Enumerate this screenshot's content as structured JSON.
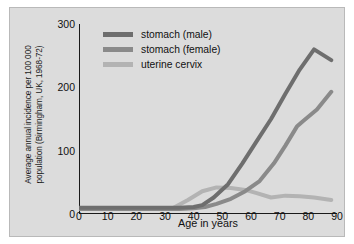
{
  "chart_data": {
    "type": "line",
    "title": "",
    "xlabel": "Age in years",
    "ylabel": "Average annual incidence per 100 000 population (Birmingham, UK, 1968-72)",
    "xlim": [
      0,
      90
    ],
    "ylim": [
      0,
      300
    ],
    "xticks": [
      0,
      10,
      20,
      30,
      40,
      50,
      60,
      70,
      80,
      90
    ],
    "yticks": [
      0,
      100,
      200,
      300
    ],
    "grid": false,
    "legend_position": "top-left-inside",
    "series": [
      {
        "name": "stomach (male)",
        "color": "#6e6e6e",
        "x": [
          0,
          10,
          20,
          30,
          35,
          40,
          43,
          47,
          52,
          57,
          62,
          67,
          72,
          77,
          82,
          88
        ],
        "y": [
          10,
          10,
          10,
          10,
          10,
          11,
          14,
          26,
          47,
          80,
          115,
          150,
          190,
          228,
          260,
          243
        ]
      },
      {
        "name": "stomach (female)",
        "color": "#8a8a8a",
        "x": [
          0,
          10,
          20,
          30,
          35,
          40,
          44,
          48,
          53,
          58,
          63,
          68,
          72,
          76,
          78,
          83,
          88
        ],
        "y": [
          8,
          8,
          8,
          8,
          8,
          9,
          11,
          16,
          24,
          36,
          52,
          80,
          108,
          138,
          146,
          165,
          193
        ]
      },
      {
        "name": "uterine cervix",
        "color": "#b3b3b3",
        "x": [
          0,
          10,
          20,
          30,
          33,
          38,
          43,
          48,
          53,
          58,
          62,
          67,
          72,
          77,
          82,
          88
        ],
        "y": [
          8,
          8,
          8,
          8,
          10,
          22,
          36,
          42,
          41,
          38,
          33,
          26,
          29,
          28,
          26,
          22
        ]
      }
    ]
  },
  "legend": {
    "items": [
      {
        "label": "stomach (male)",
        "color": "#6e6e6e"
      },
      {
        "label": "stomach (female)",
        "color": "#8a8a8a"
      },
      {
        "label": "uterine cervix",
        "color": "#b3b3b3"
      }
    ]
  },
  "axis": {
    "y_title": "Average annual incidence per 100 000\npopulation (Birmingham, UK, 1968-72)",
    "x_title": "Age in years"
  },
  "style": {
    "panel_background": "#dcdcdc",
    "page_background": "#ffffff",
    "axis_color": "#1a1a1a"
  }
}
